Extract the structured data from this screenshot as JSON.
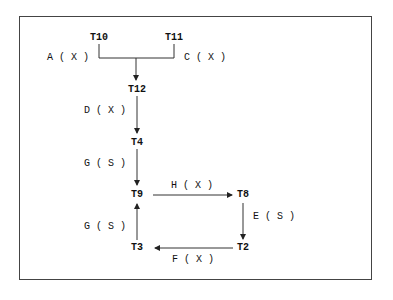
{
  "diagram": {
    "nodes": [
      {
        "id": "T10",
        "label": "T10"
      },
      {
        "id": "T11",
        "label": "T11"
      },
      {
        "id": "T12",
        "label": "T12"
      },
      {
        "id": "T4",
        "label": "T4"
      },
      {
        "id": "T9",
        "label": "T9"
      },
      {
        "id": "T8",
        "label": "T8"
      },
      {
        "id": "T2",
        "label": "T2"
      },
      {
        "id": "T3",
        "label": "T3"
      }
    ],
    "edges": [
      {
        "from": "T10",
        "to": "T12",
        "label": "A ( X )"
      },
      {
        "from": "T11",
        "to": "T12",
        "label": "C ( X )"
      },
      {
        "from": "T12",
        "to": "T4",
        "label": "D ( X )"
      },
      {
        "from": "T4",
        "to": "T9",
        "label": "G ( S )"
      },
      {
        "from": "T9",
        "to": "T8",
        "label": "H ( X )"
      },
      {
        "from": "T8",
        "to": "T2",
        "label": "E ( S )"
      },
      {
        "from": "T2",
        "to": "T3",
        "label": "F ( X )"
      },
      {
        "from": "T3",
        "to": "T9",
        "label": "G ( S )"
      }
    ]
  }
}
